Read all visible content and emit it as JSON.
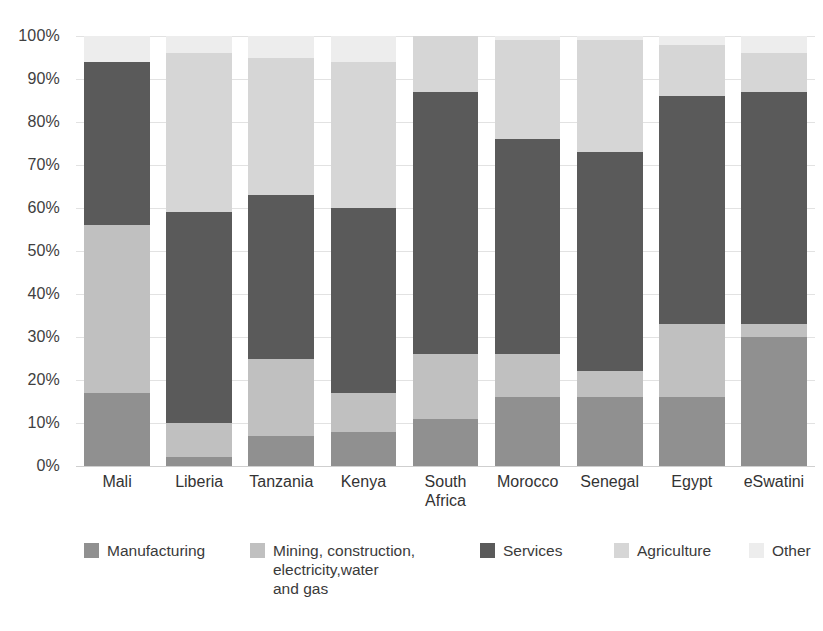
{
  "chart_data": {
    "type": "bar",
    "stacked": true,
    "stack_mode": "percent",
    "title": "",
    "subtitle": "",
    "xlabel": "",
    "ylabel": "",
    "ylim": [
      0,
      100
    ],
    "ytick_labels": [
      "0%",
      "10%",
      "20%",
      "30%",
      "40%",
      "50%",
      "60%",
      "70%",
      "80%",
      "90%",
      "100%"
    ],
    "ytick_values": [
      0,
      10,
      20,
      30,
      40,
      50,
      60,
      70,
      80,
      90,
      100
    ],
    "grid": true,
    "legend_position": "bottom",
    "categories": [
      "Mali",
      "Liberia",
      "Tanzania",
      "Kenya",
      "South\nAfrica",
      "Morocco",
      "Senegal",
      "Egypt",
      "eSwatini"
    ],
    "category_labels": [
      "Mali",
      "Liberia",
      "Tanzania",
      "Kenya",
      "South Africa",
      "Morocco",
      "Senegal",
      "Egypt",
      "eSwatini"
    ],
    "series": [
      {
        "name": "Manufacturing",
        "color": "#909090",
        "values": [
          17,
          2,
          7,
          8,
          11,
          16,
          16,
          16,
          30
        ]
      },
      {
        "name": "Mining, construction,\nelectricity,water\nand gas",
        "color": "#c0c0c0",
        "values": [
          39,
          8,
          18,
          9,
          15,
          10,
          6,
          17,
          3
        ]
      },
      {
        "name": "Services",
        "color": "#5a5a5a",
        "values": [
          38,
          49,
          38,
          43,
          61,
          50,
          51,
          53,
          54
        ]
      },
      {
        "name": "Agriculture",
        "color": "#d6d6d6",
        "values": [
          0,
          37,
          32,
          34,
          13,
          23,
          26,
          12,
          9
        ]
      },
      {
        "name": "Other",
        "color": "#ededed",
        "values": [
          6,
          4,
          5,
          6,
          0,
          1,
          1,
          2,
          4
        ]
      }
    ]
  },
  "legend": {
    "items": [
      {
        "label": "Manufacturing",
        "color": "#909090",
        "left": 0
      },
      {
        "label": "Mining, construction,\nelectricity,water\nand gas",
        "color": "#c0c0c0",
        "left": 166
      },
      {
        "label": "Services",
        "color": "#5a5a5a",
        "left": 396
      },
      {
        "label": "Agriculture",
        "color": "#d6d6d6",
        "left": 530
      },
      {
        "label": "Other",
        "color": "#ededed",
        "left": 665
      }
    ]
  }
}
